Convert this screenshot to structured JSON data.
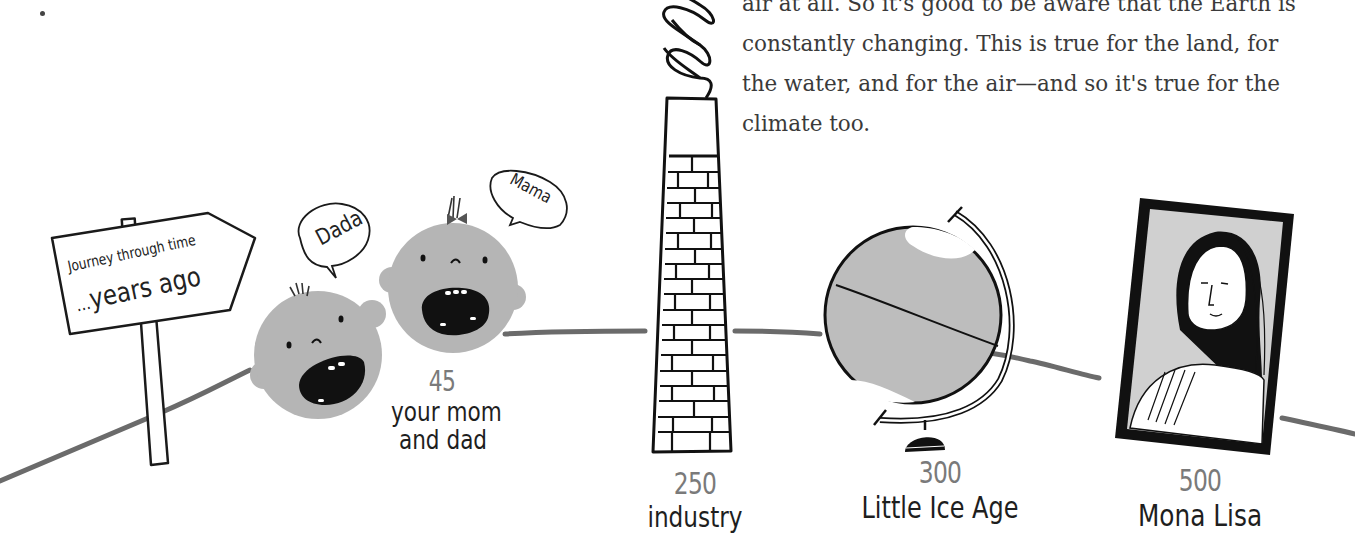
{
  "body_text": {
    "lines": [
      "air at all. So it's good to be aware that the Earth is",
      "constantly changing. This is true for the land, for",
      "the water, and for the air—and so it's true for the",
      "climate too."
    ]
  },
  "signpost": {
    "line1": "Journey through time",
    "line2_prefix": "...",
    "line2": "years ago"
  },
  "timeline": [
    {
      "years": "45",
      "label_line1": "your mom",
      "label_line2": "and dad",
      "icon": "baby-faces"
    },
    {
      "years": "250",
      "label_line1": "industry",
      "label_line2": "",
      "icon": "brick-chimney"
    },
    {
      "years": "300",
      "label_line1": "Little Ice Age",
      "label_line2": "",
      "icon": "globe"
    },
    {
      "years": "500",
      "label_line1": "Mona Lisa",
      "label_line2": "",
      "icon": "framed-portrait"
    }
  ],
  "speech_bubbles": {
    "dad": "Dada",
    "mom": "Mama"
  },
  "colors": {
    "ground_line": "#6b6b6b",
    "face_fill": "#b5b5b5",
    "globe_fill": "#bdbdbd",
    "ink": "#111111",
    "year_text": "#7a7a7a",
    "body_text": "#3a3a3a"
  }
}
